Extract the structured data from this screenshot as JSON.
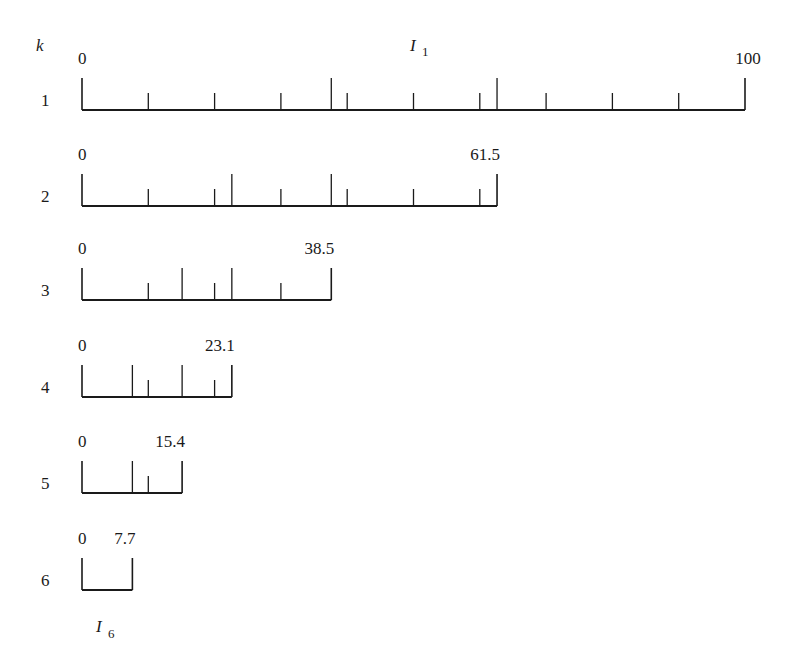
{
  "header": {
    "k_label": "k",
    "top_interval_label": "I",
    "top_interval_sub": "1",
    "bottom_interval_label": "I",
    "bottom_interval_sub": "6"
  },
  "layout": {
    "x0": 82,
    "px_per_unit": 6.63,
    "end_tick_height": 32,
    "long_tick_height": 32,
    "short_tick_height": 17
  },
  "rows": [
    {
      "k": "1",
      "start_label": "0",
      "end_label": "100",
      "length": 100,
      "baseline_y": 110,
      "long_ticks": [
        37.6,
        62.6
      ],
      "short_ticks": [
        10,
        20,
        30,
        40,
        50,
        60,
        70,
        80,
        90
      ]
    },
    {
      "k": "2",
      "start_label": "0",
      "end_label": "61.5",
      "length": 62.6,
      "baseline_y": 206,
      "long_ticks": [
        22.6,
        37.6
      ],
      "short_ticks": [
        10,
        20,
        30,
        40,
        50,
        60
      ]
    },
    {
      "k": "3",
      "start_label": "0",
      "end_label": "38.5",
      "length": 37.6,
      "baseline_y": 300,
      "long_ticks": [
        15.1,
        22.6
      ],
      "short_ticks": [
        10,
        20,
        30
      ]
    },
    {
      "k": "4",
      "start_label": "0",
      "end_label": "23.1",
      "length": 22.6,
      "baseline_y": 397,
      "long_ticks": [
        7.6,
        15.1
      ],
      "short_ticks": [
        10,
        20
      ]
    },
    {
      "k": "5",
      "start_label": "0",
      "end_label": "15.4",
      "length": 15.1,
      "baseline_y": 493,
      "long_ticks": [
        7.6
      ],
      "short_ticks": [
        10
      ]
    },
    {
      "k": "6",
      "start_label": "0",
      "end_label": "7.7",
      "length": 7.6,
      "baseline_y": 590,
      "long_ticks": [],
      "short_ticks": []
    }
  ],
  "chart_data": {
    "type": "diagram",
    "xlabel": "",
    "ylabel": "k",
    "intervals": [
      {
        "k": 1,
        "start": 0,
        "end": 100
      },
      {
        "k": 2,
        "start": 0,
        "end": 61.5
      },
      {
        "k": 3,
        "start": 0,
        "end": 38.5
      },
      {
        "k": 4,
        "start": 0,
        "end": 23.1
      },
      {
        "k": 5,
        "start": 0,
        "end": 15.4
      },
      {
        "k": 6,
        "start": 0,
        "end": 7.7
      }
    ],
    "annotations": [
      "I_1 (above row 1)",
      "I_6 (below row 6)"
    ]
  }
}
